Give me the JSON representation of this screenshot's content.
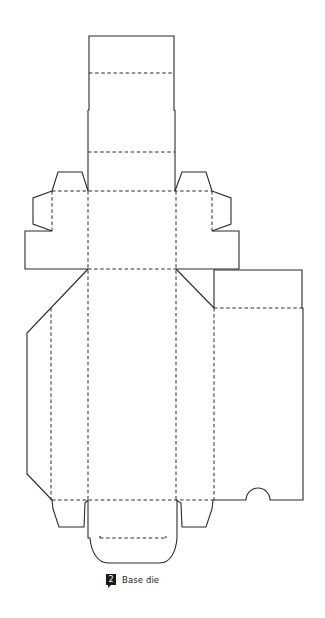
{
  "figure": {
    "number": "2",
    "caption": "Base die"
  },
  "legend": {
    "cut_line": "solid",
    "fold_line": "dashed"
  },
  "colors": {
    "line": "#2a2a2a",
    "badge": "#1a1a1a",
    "background": "#ffffff"
  },
  "dieline": {
    "cut_paths": [
      {
        "name": "top-panel-outline",
        "d": "M88 110 L89 110 L89 36 L174 36 L174 110 L175 110"
      },
      {
        "name": "top-panel-left-edge",
        "d": "M88 110 L88 191"
      },
      {
        "name": "top-panel-right-edge",
        "d": "M175 110 L175 191"
      },
      {
        "name": "left-top-tab",
        "d": "M88 191 L82 172 L58 172 L52 191"
      },
      {
        "name": "left-side-tab",
        "d": "M52 191 L33 198 L33 224 L52 231"
      },
      {
        "name": "left-wing-flap",
        "d": "M52 231 L25 231 L25 269 L88 269"
      },
      {
        "name": "right-top-tab",
        "d": "M175 191 L182 172 L206 172 L212 191"
      },
      {
        "name": "right-side-tab",
        "d": "M212 191 L231 198 L231 224 L212 231"
      },
      {
        "name": "right-wing-flap",
        "d": "M212 231 L239 231 L239 269 L176 269"
      },
      {
        "name": "left-diagonal-upper",
        "d": "M88 269 L27 333 L27 474 L52 500"
      },
      {
        "name": "right-diagonal",
        "d": "M176 269 L214 308"
      },
      {
        "name": "glue-panel-top",
        "d": "M214 308 L214 270 L302 270 L302 308 L303 308"
      },
      {
        "name": "glue-panel-right-and-bottom",
        "d": "M303 308 L303 500 L270 500 A12 12 0 0 0 246 500 L214 500"
      },
      {
        "name": "left-bottom-tab",
        "d": "M52 500 L53 509 L59 527 L84 527 L85 503 L88 500"
      },
      {
        "name": "right-bottom-tab",
        "d": "M176 500 L181 503 L182 527 L206 527 L212 509 L213 500"
      },
      {
        "name": "bottom-flap",
        "d": "M88 500 L88 538 L90 538 C91 552 98 563 108 563 L160 563 C170 563 176 552 177 538 L177 500"
      },
      {
        "name": "bottom-flap-notches",
        "d": "M100 536 L100 538 M166 536 L166 538"
      }
    ],
    "fold_paths": [
      {
        "name": "top-fold-1",
        "d": "M89 73 L174 73"
      },
      {
        "name": "top-fold-2",
        "d": "M88 152 L175 152"
      },
      {
        "name": "top-fold-3",
        "d": "M52 191 L212 191"
      },
      {
        "name": "middle-fold",
        "d": "M88 269 L176 269"
      },
      {
        "name": "left-wing-vertical",
        "d": "M52 191 L52 231"
      },
      {
        "name": "right-wing-vertical",
        "d": "M212 191 L212 231"
      },
      {
        "name": "left-main-vertical",
        "d": "M88 191 L88 500"
      },
      {
        "name": "right-main-vertical",
        "d": "M176 191 L176 500"
      },
      {
        "name": "left-panel-vertical",
        "d": "M51 308 L51 500"
      },
      {
        "name": "right-panel-vertical",
        "d": "M214 308 L214 500"
      },
      {
        "name": "glue-panel-fold",
        "d": "M214 308 L303 308"
      },
      {
        "name": "bottom-fold",
        "d": "M52 500 L214 500"
      },
      {
        "name": "bottom-flap-fold",
        "d": "M100 538 L166 538"
      }
    ]
  }
}
